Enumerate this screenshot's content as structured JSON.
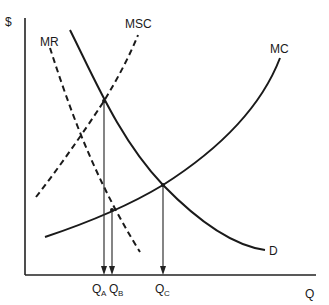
{
  "diagram": {
    "axes": {
      "y_label": "$",
      "x_label": "Q"
    },
    "curves": [
      {
        "name": "MR",
        "label": "MR",
        "style": "dashed"
      },
      {
        "name": "MSC",
        "label": "MSC",
        "style": "dashed"
      },
      {
        "name": "MC",
        "label": "MC",
        "style": "solid"
      },
      {
        "name": "D",
        "label": "D",
        "style": "solid"
      }
    ],
    "quantities": [
      {
        "label_main": "Q",
        "label_sub": "A"
      },
      {
        "label_main": "Q",
        "label_sub": "B"
      },
      {
        "label_main": "Q",
        "label_sub": "C"
      }
    ]
  }
}
